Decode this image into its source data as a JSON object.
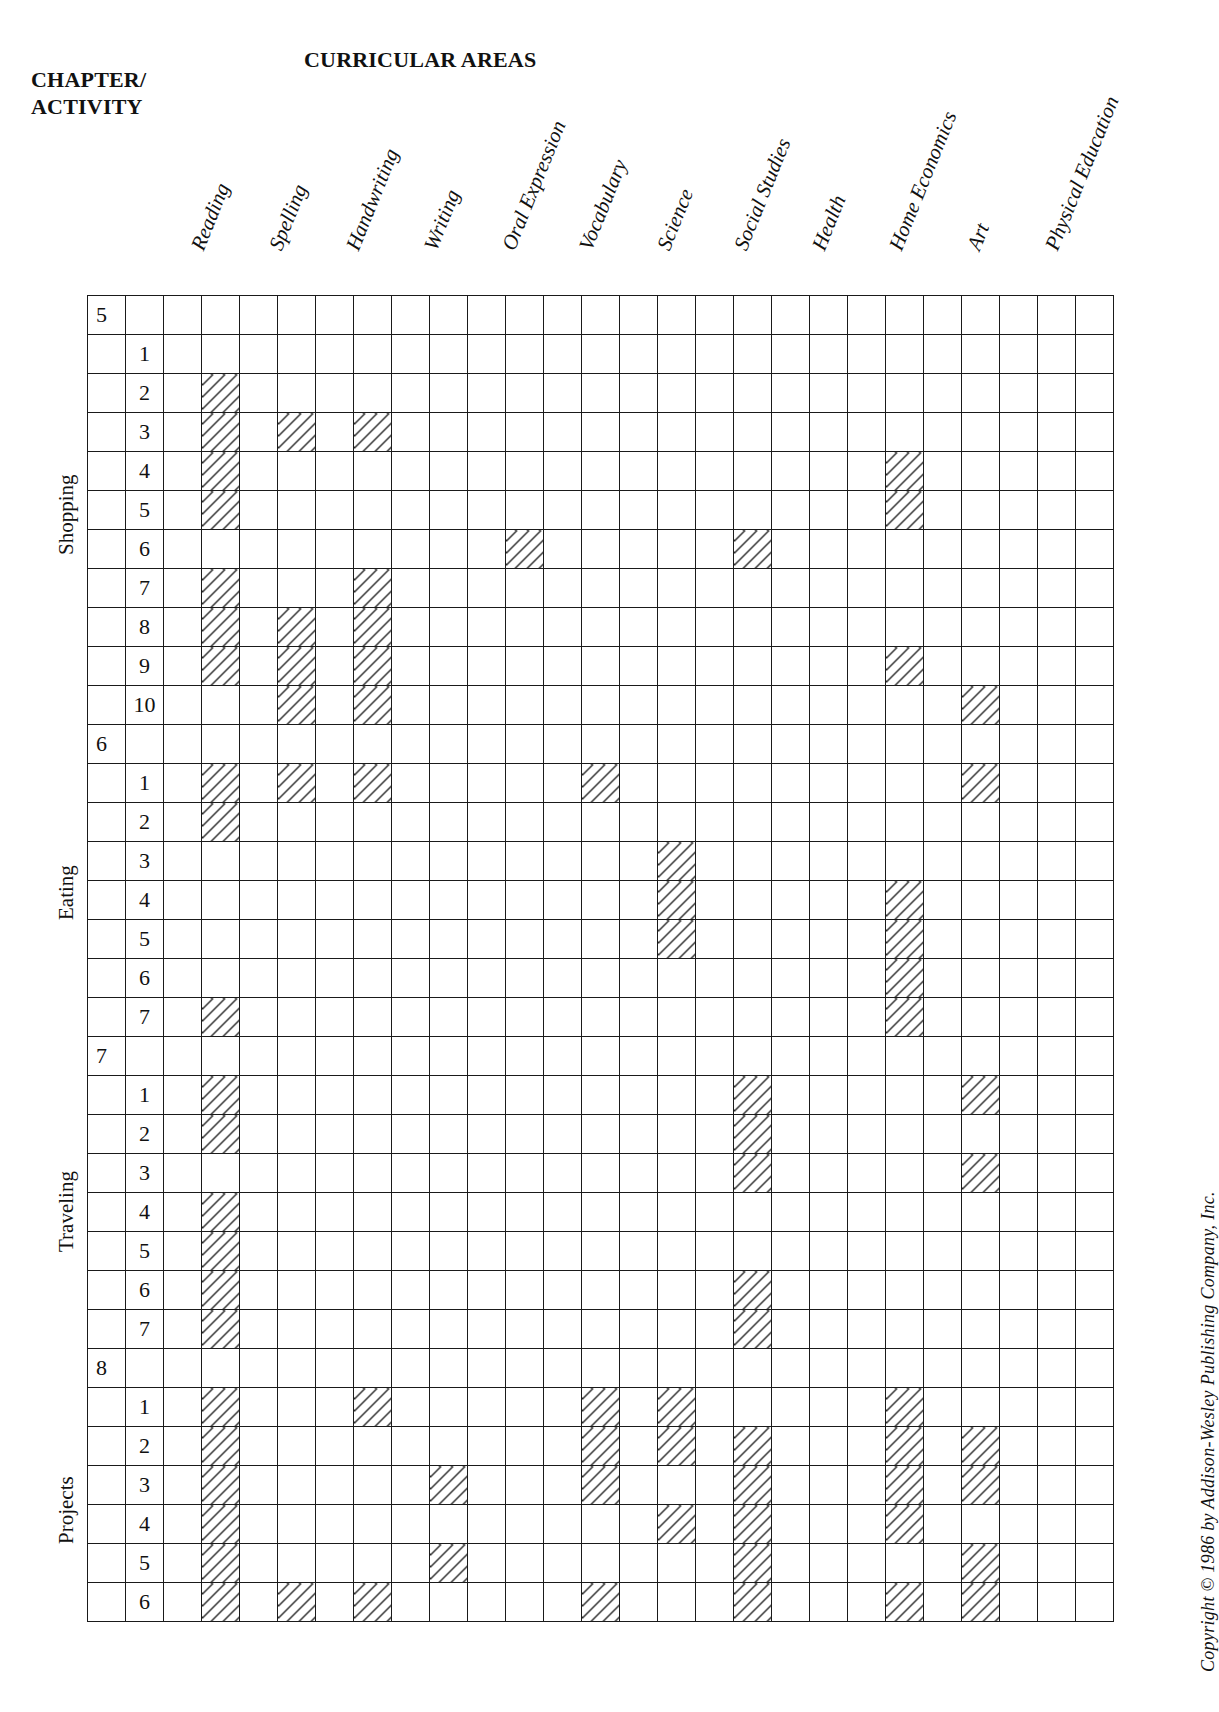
{
  "headers": {
    "chapter_activity_line1": "CHAPTER/",
    "chapter_activity_line2": "ACTIVITY",
    "curricular_areas": "CURRICULAR AREAS"
  },
  "subjects": [
    {
      "label": "Reading",
      "col": 3
    },
    {
      "label": "Spelling",
      "col": 5
    },
    {
      "label": "Handwriting",
      "col": 7
    },
    {
      "label": "Writing",
      "col": 9
    },
    {
      "label": "Oral Expression",
      "col": 11
    },
    {
      "label": "Vocabulary",
      "col": 13
    },
    {
      "label": "Science",
      "col": 15
    },
    {
      "label": "Social Studies",
      "col": 17
    },
    {
      "label": "Health",
      "col": 19
    },
    {
      "label": "Home Economics",
      "col": 21
    },
    {
      "label": "Art",
      "col": 23
    },
    {
      "label": "Physical Education",
      "col": 25
    }
  ],
  "chapters": [
    {
      "number": "5",
      "name": "Shopping",
      "activities": [
        {
          "n": "1",
          "subjects": []
        },
        {
          "n": "2",
          "subjects": [
            "Reading"
          ]
        },
        {
          "n": "3",
          "subjects": [
            "Reading",
            "Spelling",
            "Handwriting"
          ]
        },
        {
          "n": "4",
          "subjects": [
            "Reading",
            "Home Economics"
          ]
        },
        {
          "n": "5",
          "subjects": [
            "Reading",
            "Home Economics"
          ]
        },
        {
          "n": "6",
          "subjects": [
            "Oral Expression",
            "Social Studies"
          ]
        },
        {
          "n": "7",
          "subjects": [
            "Reading",
            "Handwriting"
          ]
        },
        {
          "n": "8",
          "subjects": [
            "Reading",
            "Spelling",
            "Handwriting"
          ]
        },
        {
          "n": "9",
          "subjects": [
            "Reading",
            "Spelling",
            "Handwriting",
            "Home Economics"
          ]
        },
        {
          "n": "10",
          "subjects": [
            "Spelling",
            "Handwriting",
            "Art"
          ]
        }
      ]
    },
    {
      "number": "6",
      "name": "Eating",
      "activities": [
        {
          "n": "1",
          "subjects": [
            "Reading",
            "Spelling",
            "Handwriting",
            "Vocabulary",
            "Art"
          ]
        },
        {
          "n": "2",
          "subjects": [
            "Reading"
          ]
        },
        {
          "n": "3",
          "subjects": [
            "Science"
          ]
        },
        {
          "n": "4",
          "subjects": [
            "Science",
            "Home Economics"
          ]
        },
        {
          "n": "5",
          "subjects": [
            "Science",
            "Home Economics"
          ]
        },
        {
          "n": "6",
          "subjects": [
            "Home Economics"
          ]
        },
        {
          "n": "7",
          "subjects": [
            "Reading",
            "Home Economics"
          ]
        }
      ]
    },
    {
      "number": "7",
      "name": "Traveling",
      "activities": [
        {
          "n": "1",
          "subjects": [
            "Reading",
            "Social Studies",
            "Art"
          ]
        },
        {
          "n": "2",
          "subjects": [
            "Reading",
            "Social Studies"
          ]
        },
        {
          "n": "3",
          "subjects": [
            "Social Studies",
            "Art"
          ]
        },
        {
          "n": "4",
          "subjects": [
            "Reading"
          ]
        },
        {
          "n": "5",
          "subjects": [
            "Reading"
          ]
        },
        {
          "n": "6",
          "subjects": [
            "Reading",
            "Social Studies"
          ]
        },
        {
          "n": "7",
          "subjects": [
            "Reading",
            "Social Studies"
          ]
        }
      ]
    },
    {
      "number": "8",
      "name": "Projects",
      "activities": [
        {
          "n": "1",
          "subjects": [
            "Reading",
            "Handwriting",
            "Vocabulary",
            "Science",
            "Home Economics"
          ]
        },
        {
          "n": "2",
          "subjects": [
            "Reading",
            "Vocabulary",
            "Science",
            "Social Studies",
            "Home Economics",
            "Art"
          ]
        },
        {
          "n": "3",
          "subjects": [
            "Reading",
            "Writing",
            "Vocabulary",
            "Social Studies",
            "Home Economics",
            "Art"
          ]
        },
        {
          "n": "4",
          "subjects": [
            "Reading",
            "Science",
            "Social Studies",
            "Home Economics"
          ]
        },
        {
          "n": "5",
          "subjects": [
            "Reading",
            "Writing",
            "Social Studies",
            "Art"
          ]
        },
        {
          "n": "6",
          "subjects": [
            "Reading",
            "Spelling",
            "Handwriting",
            "Vocabulary",
            "Social Studies",
            "Home Economics",
            "Art"
          ]
        }
      ]
    }
  ],
  "grid": {
    "total_columns": 27,
    "hatch_color": "#2a2a2a",
    "line_color": "#1a1a1a"
  },
  "footer": {
    "copyright": "Copyright © 1986 by Addison-Wesley Publishing Company, Inc."
  }
}
